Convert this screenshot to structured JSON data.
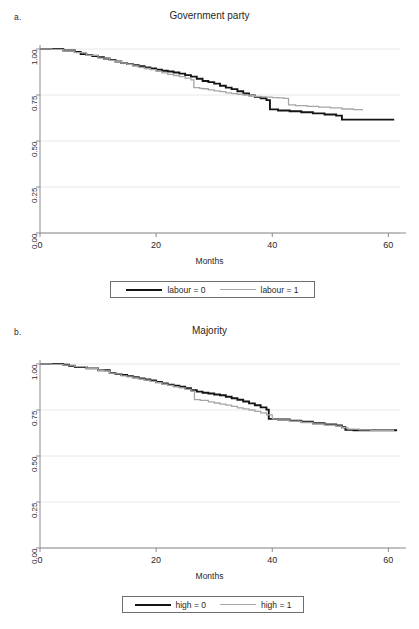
{
  "figure": {
    "width": 419,
    "height": 629,
    "background": "#ffffff",
    "colors": {
      "series_0": "#141414",
      "series_1": "#a6a6a6",
      "axis": "#8a8a8a",
      "grid": "#e8e8e8",
      "text": "#1f1f1f"
    }
  },
  "panels": [
    {
      "letter": "a.",
      "title": "Government party",
      "xlabel": "Months",
      "legend": [
        {
          "label": "labour = 0",
          "style": "solid-black"
        },
        {
          "label": "labour = 1",
          "style": "solid-grey"
        }
      ]
    },
    {
      "letter": "b.",
      "title": "Majority",
      "xlabel": "Months",
      "legend": [
        {
          "label": "high = 0",
          "style": "solid-black"
        },
        {
          "label": "high = 1",
          "style": "solid-grey"
        }
      ]
    }
  ],
  "chart_data": [
    {
      "type": "line",
      "panel": "a",
      "title": "Government party",
      "xlabel": "Months",
      "ylabel": "",
      "xlim": [
        0,
        62
      ],
      "ylim": [
        0,
        1
      ],
      "xticks": [
        0,
        20,
        40,
        60
      ],
      "xtick_labels": [
        "0",
        "20",
        "40",
        "60"
      ],
      "yticks": [
        0.0,
        0.25,
        0.5,
        0.75,
        1.0
      ],
      "ytick_labels": [
        "0.00",
        "0.25",
        "0.50",
        "0.75",
        "1.00"
      ],
      "grid": "horizontal",
      "legend_position": "below",
      "series": [
        {
          "name": "labour = 0",
          "color": "#141414",
          "width": 1.9,
          "step": "post",
          "x": [
            0,
            2,
            4,
            6,
            7,
            8,
            9,
            10,
            11,
            12,
            13,
            14,
            15,
            16,
            17,
            18,
            19,
            20,
            21,
            22,
            23,
            24,
            25,
            26,
            27,
            28,
            29,
            30,
            31,
            32,
            33,
            34,
            35,
            36,
            37,
            38,
            39,
            39.6,
            41,
            43,
            45,
            47,
            49,
            51,
            52,
            53,
            55,
            57,
            59,
            61
          ],
          "y": [
            1.0,
            1.0,
            0.992,
            0.984,
            0.972,
            0.968,
            0.962,
            0.956,
            0.948,
            0.94,
            0.932,
            0.924,
            0.918,
            0.912,
            0.906,
            0.9,
            0.894,
            0.888,
            0.882,
            0.878,
            0.872,
            0.866,
            0.858,
            0.85,
            0.838,
            0.826,
            0.82,
            0.812,
            0.8,
            0.79,
            0.782,
            0.77,
            0.758,
            0.748,
            0.74,
            0.732,
            0.722,
            0.672,
            0.666,
            0.662,
            0.656,
            0.65,
            0.644,
            0.638,
            0.616,
            0.616,
            0.616,
            0.616,
            0.616,
            0.616
          ]
        },
        {
          "name": "labour = 1",
          "color": "#a6a6a6",
          "width": 1.3,
          "step": "post",
          "x": [
            0,
            2,
            4,
            6,
            8,
            10,
            12,
            13,
            14,
            15,
            16,
            17,
            18,
            19,
            20,
            21,
            22,
            23,
            24,
            25,
            26,
            26.5,
            27.5,
            28,
            29,
            30,
            31,
            32,
            33,
            34,
            35,
            36,
            37,
            38,
            39,
            40,
            41,
            42,
            42.8,
            44,
            46,
            48,
            50,
            52,
            54,
            55.5
          ],
          "y": [
            1.0,
            0.998,
            0.99,
            0.98,
            0.966,
            0.95,
            0.938,
            0.932,
            0.924,
            0.916,
            0.908,
            0.9,
            0.894,
            0.888,
            0.878,
            0.87,
            0.862,
            0.856,
            0.85,
            0.842,
            0.832,
            0.79,
            0.786,
            0.784,
            0.778,
            0.772,
            0.768,
            0.762,
            0.758,
            0.754,
            0.75,
            0.746,
            0.742,
            0.74,
            0.738,
            0.736,
            0.734,
            0.732,
            0.696,
            0.692,
            0.688,
            0.684,
            0.68,
            0.674,
            0.67,
            0.666
          ]
        }
      ]
    },
    {
      "type": "line",
      "panel": "b",
      "title": "Majority",
      "xlabel": "Months",
      "ylabel": "",
      "xlim": [
        0,
        62
      ],
      "ylim": [
        0,
        1
      ],
      "xticks": [
        0,
        20,
        40,
        60
      ],
      "xtick_labels": [
        "0",
        "20",
        "40",
        "60"
      ],
      "yticks": [
        0.0,
        0.25,
        0.5,
        0.75,
        1.0
      ],
      "ytick_labels": [
        "0.00",
        "0.25",
        "0.50",
        "0.75",
        "1.00"
      ],
      "grid": "horizontal",
      "legend_position": "below",
      "series": [
        {
          "name": "high = 0",
          "color": "#141414",
          "width": 1.9,
          "step": "post",
          "x": [
            0,
            2,
            4,
            5,
            6,
            8,
            10,
            12,
            13,
            14,
            15,
            16,
            17,
            18,
            19,
            20,
            21,
            22,
            23,
            24,
            25,
            26,
            27,
            28,
            29,
            30,
            31,
            32,
            33,
            34,
            35,
            36,
            37,
            38,
            39,
            39.4,
            41,
            43,
            45,
            47,
            49,
            51,
            52,
            52.6,
            54,
            56,
            58,
            60,
            61.5
          ],
          "y": [
            1.0,
            1.0,
            0.996,
            0.99,
            0.984,
            0.976,
            0.966,
            0.952,
            0.946,
            0.94,
            0.934,
            0.928,
            0.922,
            0.916,
            0.91,
            0.902,
            0.894,
            0.888,
            0.882,
            0.876,
            0.868,
            0.858,
            0.85,
            0.844,
            0.84,
            0.834,
            0.83,
            0.822,
            0.814,
            0.806,
            0.796,
            0.786,
            0.776,
            0.764,
            0.752,
            0.702,
            0.698,
            0.692,
            0.686,
            0.678,
            0.672,
            0.666,
            0.656,
            0.642,
            0.64,
            0.64,
            0.64,
            0.64,
            0.64
          ]
        },
        {
          "name": "high = 1",
          "color": "#a6a6a6",
          "width": 1.3,
          "step": "post",
          "x": [
            0,
            2,
            4,
            6,
            8,
            10,
            11,
            12,
            13,
            14,
            15,
            16,
            17,
            18,
            19,
            20,
            21,
            22,
            23,
            24,
            25,
            26,
            26.6,
            27.6,
            29,
            30,
            31,
            32,
            33,
            34,
            35,
            36,
            37,
            38,
            39,
            40,
            41,
            43,
            45,
            47,
            49,
            51,
            52,
            53,
            55,
            57,
            59,
            61
          ],
          "y": [
            1.0,
            0.998,
            0.994,
            0.986,
            0.976,
            0.966,
            0.962,
            0.95,
            0.946,
            0.936,
            0.93,
            0.924,
            0.918,
            0.912,
            0.906,
            0.898,
            0.89,
            0.884,
            0.876,
            0.87,
            0.862,
            0.852,
            0.806,
            0.802,
            0.794,
            0.788,
            0.782,
            0.776,
            0.77,
            0.762,
            0.756,
            0.75,
            0.742,
            0.734,
            0.724,
            0.702,
            0.696,
            0.69,
            0.682,
            0.674,
            0.668,
            0.662,
            0.654,
            0.646,
            0.642,
            0.64,
            0.64,
            0.64
          ]
        }
      ]
    }
  ]
}
